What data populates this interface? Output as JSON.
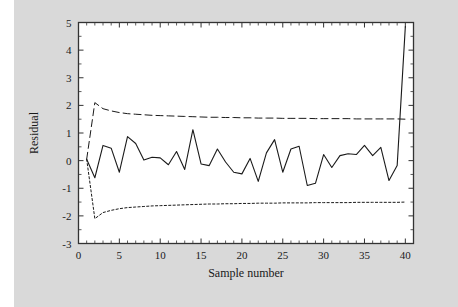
{
  "figure": {
    "background_color": "#d9d9d9",
    "plot_background_color": "#ffffff",
    "frame_color": "#333333",
    "left_margin_color": "#ffffff"
  },
  "chart_data": {
    "type": "line",
    "title": "",
    "xlabel": "Sample number",
    "ylabel": "Residual",
    "xlim": [
      0,
      41
    ],
    "ylim": [
      -3,
      5
    ],
    "xticks": [
      0,
      5,
      10,
      15,
      20,
      25,
      30,
      35,
      40
    ],
    "xtick_labels": [
      "0",
      "5",
      "10",
      "15",
      "20",
      "25",
      "30",
      "35",
      "40"
    ],
    "yticks": [
      -3,
      -2,
      -1,
      0,
      1,
      2,
      3,
      4,
      5
    ],
    "ytick_labels": [
      "-3",
      "-2",
      "-1",
      "0",
      "1",
      "2",
      "3",
      "4",
      "5"
    ],
    "xminor_ticks": [
      1,
      2,
      3,
      4,
      6,
      7,
      8,
      9,
      11,
      12,
      13,
      14,
      16,
      17,
      18,
      19,
      21,
      22,
      23,
      24,
      26,
      27,
      28,
      29,
      31,
      32,
      33,
      34,
      36,
      37,
      38,
      39
    ],
    "grid": false,
    "legend": "none",
    "line_color": "#1a1a1a",
    "x": [
      1,
      2,
      3,
      4,
      5,
      6,
      7,
      8,
      9,
      10,
      11,
      12,
      13,
      14,
      15,
      16,
      17,
      18,
      19,
      20,
      21,
      22,
      23,
      24,
      25,
      26,
      27,
      28,
      29,
      30,
      31,
      32,
      33,
      34,
      35,
      36,
      37,
      38,
      39,
      40
    ],
    "series": [
      {
        "name": "Residual",
        "style": "solid",
        "color": "#1a1a1a",
        "values": [
          0.05,
          -0.62,
          0.55,
          0.45,
          -0.42,
          0.87,
          0.62,
          0.02,
          0.12,
          0.1,
          -0.15,
          0.33,
          -0.32,
          1.12,
          -0.12,
          -0.18,
          0.42,
          -0.05,
          -0.42,
          -0.48,
          0.08,
          -0.75,
          0.28,
          0.76,
          -0.42,
          0.42,
          0.52,
          -0.9,
          -0.82,
          0.22,
          -0.25,
          0.18,
          0.25,
          0.22,
          0.55,
          0.18,
          0.48,
          -0.72,
          -0.18,
          4.85
        ]
      },
      {
        "name": "Upper control limit",
        "style": "dashed",
        "color": "#1a1a1a",
        "values": [
          0.05,
          2.1,
          1.88,
          1.8,
          1.74,
          1.7,
          1.68,
          1.66,
          1.64,
          1.63,
          1.62,
          1.61,
          1.6,
          1.59,
          1.58,
          1.57,
          1.57,
          1.56,
          1.56,
          1.55,
          1.55,
          1.54,
          1.54,
          1.54,
          1.53,
          1.53,
          1.53,
          1.53,
          1.52,
          1.52,
          1.52,
          1.52,
          1.52,
          1.51,
          1.51,
          1.51,
          1.51,
          1.51,
          1.51,
          1.5
        ]
      },
      {
        "name": "Lower control limit",
        "style": "dotted",
        "color": "#1a1a1a",
        "values": [
          0.05,
          -2.1,
          -1.88,
          -1.8,
          -1.74,
          -1.7,
          -1.68,
          -1.66,
          -1.64,
          -1.63,
          -1.62,
          -1.61,
          -1.6,
          -1.59,
          -1.58,
          -1.57,
          -1.57,
          -1.56,
          -1.56,
          -1.55,
          -1.55,
          -1.54,
          -1.54,
          -1.54,
          -1.53,
          -1.53,
          -1.53,
          -1.53,
          -1.52,
          -1.52,
          -1.52,
          -1.52,
          -1.52,
          -1.51,
          -1.51,
          -1.51,
          -1.51,
          -1.51,
          -1.51,
          -1.5
        ]
      }
    ]
  }
}
